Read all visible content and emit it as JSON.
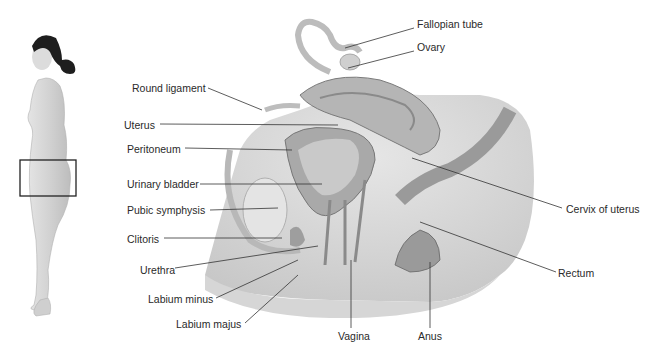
{
  "figure": {
    "locator": {
      "description": "Standing female figure, lateral view, with box indicating pelvic region"
    },
    "labels": [
      {
        "id": "fallopian-tube",
        "text": "Fallopian tube",
        "x": 417,
        "y": 24
      },
      {
        "id": "ovary",
        "text": "Ovary",
        "x": 417,
        "y": 47
      },
      {
        "id": "round-ligament",
        "text": "Round ligament",
        "x": 132,
        "y": 82
      },
      {
        "id": "uterus",
        "text": "Uterus",
        "x": 124,
        "y": 120
      },
      {
        "id": "peritoneum",
        "text": "Peritoneum",
        "x": 127,
        "y": 144
      },
      {
        "id": "urinary-bladder",
        "text": "Urinary bladder",
        "x": 127,
        "y": 179
      },
      {
        "id": "pubic-symphysis",
        "text": "Pubic symphysis",
        "x": 127,
        "y": 205
      },
      {
        "id": "clitoris",
        "text": "Clitoris",
        "x": 127,
        "y": 233
      },
      {
        "id": "urethra",
        "text": "Urethra",
        "x": 140,
        "y": 264
      },
      {
        "id": "labium-minus",
        "text": "Labium minus",
        "x": 148,
        "y": 293
      },
      {
        "id": "labium-majus",
        "text": "Labium majus",
        "x": 176,
        "y": 318
      },
      {
        "id": "cervix-of-uterus",
        "text": "Cervix of uterus",
        "x": 566,
        "y": 203
      },
      {
        "id": "rectum",
        "text": "Rectum",
        "x": 558,
        "y": 267
      },
      {
        "id": "vagina",
        "text": "Vagina",
        "x": 338,
        "y": 330
      },
      {
        "id": "anus",
        "text": "Anus",
        "x": 418,
        "y": 330
      }
    ]
  },
  "colors": {
    "text": "#2a2a2a",
    "leader": "#333333",
    "skin": "#d8d8d8",
    "tissue": "#b5b5b5",
    "dark_tissue": "#8a8a8a",
    "hair": "#1e1e1e"
  }
}
